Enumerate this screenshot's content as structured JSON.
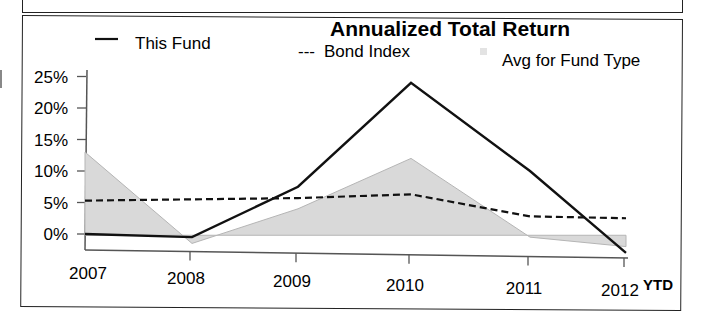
{
  "chart_data": {
    "type": "line",
    "title": "Annualized Total Return",
    "xlabel": "",
    "ylabel": "",
    "categories": [
      "2007",
      "2008",
      "2009",
      "2010",
      "2011",
      "2012"
    ],
    "x_suffix_label": "YTD",
    "y_ticks": [
      "25%",
      "20%",
      "15%",
      "10%",
      "5%",
      "0%"
    ],
    "ylim": [
      -3,
      25
    ],
    "grid": false,
    "legend_position": "top",
    "series": [
      {
        "name": "This Fund",
        "style": "solid",
        "legend_marker": "—",
        "values": [
          0,
          -0.5,
          7.5,
          24,
          10,
          -3
        ]
      },
      {
        "name": "Bond Index",
        "style": "dashed",
        "legend_marker": "---",
        "values": [
          5.3,
          5.5,
          5.7,
          6.3,
          2.8,
          2.5
        ]
      },
      {
        "name": "Avg for Fund Type",
        "style": "area",
        "legend_marker": "shaded square",
        "values": [
          13,
          -1.5,
          4,
          12,
          -0.5,
          -2
        ]
      }
    ]
  },
  "colors": {
    "fund_line": "#111111",
    "bond_line": "#111111",
    "avg_fill": "#d9d9d9",
    "avg_edge": "#b5b5b5",
    "axis": "#555555",
    "frame": "#222222"
  }
}
